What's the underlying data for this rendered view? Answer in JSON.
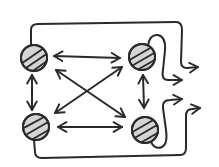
{
  "diagram": {
    "title": "",
    "style": "hand-drawn sketch",
    "colors": {
      "stroke": "#2a2a2a",
      "node_fill": "#d4d4d4",
      "background": "#ffffff"
    },
    "nodes": [
      {
        "id": "top-left",
        "label": "",
        "icon": "hatched-circle-icon"
      },
      {
        "id": "top-right",
        "label": "",
        "icon": "hatched-circle-icon"
      },
      {
        "id": "bottom-left",
        "label": "",
        "icon": "hatched-circle-icon"
      },
      {
        "id": "bottom-right",
        "label": "",
        "icon": "hatched-circle-icon"
      }
    ],
    "edges": [
      {
        "from": "top-left",
        "to": "top-right",
        "type": "bidirectional"
      },
      {
        "from": "bottom-left",
        "to": "bottom-right",
        "type": "bidirectional"
      },
      {
        "from": "top-left",
        "to": "bottom-left",
        "type": "bidirectional"
      },
      {
        "from": "top-right",
        "to": "bottom-right",
        "type": "bidirectional"
      },
      {
        "from": "top-left",
        "to": "bottom-right",
        "type": "bidirectional"
      },
      {
        "from": "bottom-left",
        "to": "top-right",
        "type": "bidirectional"
      }
    ],
    "outputs": [
      {
        "from": "top-left",
        "label": "",
        "icon": "output-arrow-icon"
      },
      {
        "from": "top-right",
        "label": "",
        "icon": "output-arrow-icon"
      },
      {
        "from": "bottom-right",
        "label": "",
        "icon": "output-arrow-icon"
      },
      {
        "from": "bottom-left",
        "label": "",
        "icon": "output-arrow-icon"
      }
    ]
  }
}
